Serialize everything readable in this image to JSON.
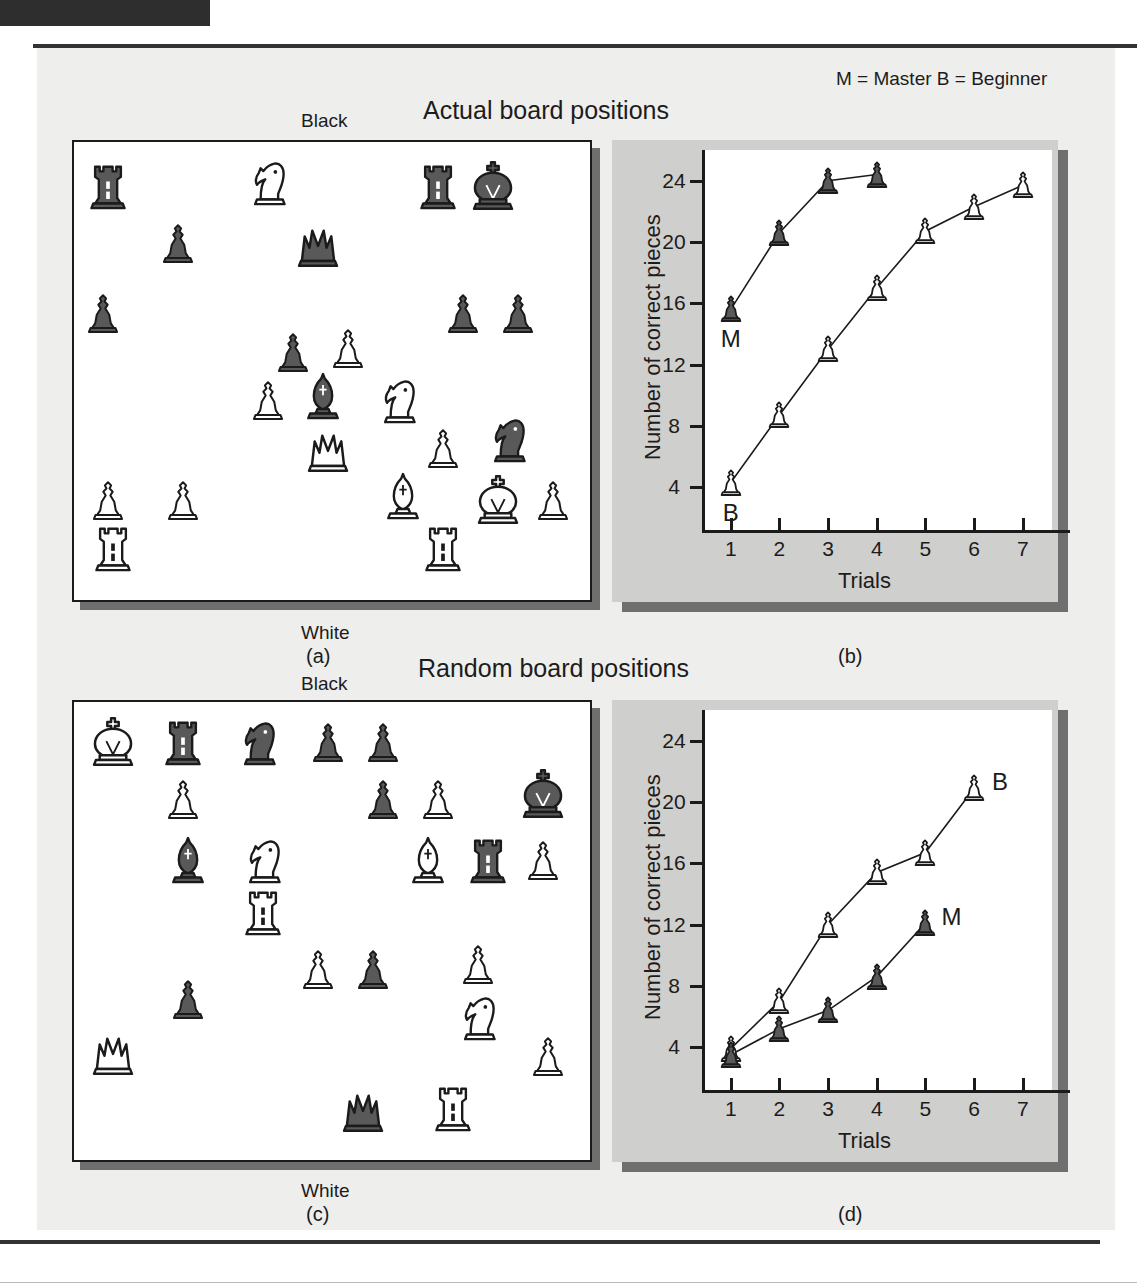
{
  "figure": {
    "legend_note": "M = Master B = Beginner",
    "heading_top": "Actual board positions",
    "heading_bottom": "Random board positions",
    "label_black": "Black",
    "label_white": "White",
    "panel_a": "(a)",
    "panel_b": "(b)",
    "panel_c": "(c)",
    "panel_d": "(d)",
    "colors": {
      "panel_bg": "#eeeeec",
      "chart_bg": "#cfcfcd",
      "plot_bg": "#ffffff",
      "ink": "#1b1b1b",
      "dark_piece": "#595959",
      "shadow": "#6f6f6f"
    }
  },
  "boards": {
    "actual": {
      "caption": "Actual board positions",
      "pieces": [
        {
          "type": "rook",
          "color": "black",
          "x": 6,
          "y": 9
        },
        {
          "type": "knight",
          "color": "white",
          "x": 38,
          "y": 8
        },
        {
          "type": "rook",
          "color": "black",
          "x": 72,
          "y": 9
        },
        {
          "type": "king",
          "color": "black",
          "x": 83,
          "y": 9
        },
        {
          "type": "pawn",
          "color": "black",
          "x": 20,
          "y": 22
        },
        {
          "type": "queen",
          "color": "black",
          "x": 48,
          "y": 22
        },
        {
          "type": "pawn",
          "color": "black",
          "x": 5,
          "y": 38
        },
        {
          "type": "pawn",
          "color": "black",
          "x": 77,
          "y": 38
        },
        {
          "type": "pawn",
          "color": "black",
          "x": 88,
          "y": 38
        },
        {
          "type": "pawn",
          "color": "black",
          "x": 43,
          "y": 47
        },
        {
          "type": "pawn",
          "color": "white",
          "x": 54,
          "y": 46
        },
        {
          "type": "pawn",
          "color": "white",
          "x": 38,
          "y": 58
        },
        {
          "type": "bishop",
          "color": "black",
          "x": 49,
          "y": 57
        },
        {
          "type": "knight",
          "color": "white",
          "x": 64,
          "y": 58
        },
        {
          "type": "queen",
          "color": "white",
          "x": 50,
          "y": 69
        },
        {
          "type": "pawn",
          "color": "white",
          "x": 73,
          "y": 69
        },
        {
          "type": "knight",
          "color": "black",
          "x": 86,
          "y": 67
        },
        {
          "type": "pawn",
          "color": "white",
          "x": 6,
          "y": 81
        },
        {
          "type": "pawn",
          "color": "white",
          "x": 21,
          "y": 81
        },
        {
          "type": "bishop",
          "color": "white",
          "x": 65,
          "y": 80
        },
        {
          "type": "king",
          "color": "white",
          "x": 84,
          "y": 81
        },
        {
          "type": "pawn",
          "color": "white",
          "x": 95,
          "y": 81
        },
        {
          "type": "rook",
          "color": "white",
          "x": 7,
          "y": 92
        },
        {
          "type": "rook",
          "color": "white",
          "x": 73,
          "y": 92
        }
      ]
    },
    "random": {
      "caption": "Random board positions",
      "pieces": [
        {
          "type": "king",
          "color": "white",
          "x": 7,
          "y": 8
        },
        {
          "type": "rook",
          "color": "black",
          "x": 21,
          "y": 8
        },
        {
          "type": "knight",
          "color": "black",
          "x": 36,
          "y": 8
        },
        {
          "type": "pawn",
          "color": "black",
          "x": 50,
          "y": 8
        },
        {
          "type": "pawn",
          "color": "black",
          "x": 61,
          "y": 8
        },
        {
          "type": "pawn",
          "color": "white",
          "x": 21,
          "y": 21
        },
        {
          "type": "pawn",
          "color": "black",
          "x": 61,
          "y": 21
        },
        {
          "type": "pawn",
          "color": "white",
          "x": 72,
          "y": 21
        },
        {
          "type": "king",
          "color": "black",
          "x": 93,
          "y": 20
        },
        {
          "type": "bishop",
          "color": "black",
          "x": 22,
          "y": 35
        },
        {
          "type": "knight",
          "color": "white",
          "x": 37,
          "y": 35
        },
        {
          "type": "bishop",
          "color": "white",
          "x": 70,
          "y": 35
        },
        {
          "type": "rook",
          "color": "black",
          "x": 82,
          "y": 35
        },
        {
          "type": "pawn",
          "color": "white",
          "x": 93,
          "y": 35
        },
        {
          "type": "rook",
          "color": "white",
          "x": 37,
          "y": 47
        },
        {
          "type": "pawn",
          "color": "white",
          "x": 48,
          "y": 60
        },
        {
          "type": "pawn",
          "color": "black",
          "x": 59,
          "y": 60
        },
        {
          "type": "pawn",
          "color": "white",
          "x": 80,
          "y": 59
        },
        {
          "type": "pawn",
          "color": "black",
          "x": 22,
          "y": 67
        },
        {
          "type": "knight",
          "color": "white",
          "x": 80,
          "y": 71
        },
        {
          "type": "queen",
          "color": "white",
          "x": 7,
          "y": 79
        },
        {
          "type": "pawn",
          "color": "white",
          "x": 94,
          "y": 80
        },
        {
          "type": "queen",
          "color": "black",
          "x": 57,
          "y": 92
        },
        {
          "type": "rook",
          "color": "white",
          "x": 75,
          "y": 92
        }
      ]
    }
  },
  "chart_data": [
    {
      "id": "b",
      "type": "line",
      "title": "Actual board positions",
      "panel_letter": "(b)",
      "xlabel": "Trials",
      "ylabel": "Number of correct pieces",
      "xticks": [
        1,
        2,
        3,
        4,
        5,
        6,
        7
      ],
      "yticks": [
        4,
        8,
        12,
        16,
        20,
        24
      ],
      "xlim": [
        0.45,
        7.6
      ],
      "ylim": [
        1.2,
        26.0
      ],
      "grid": false,
      "legend_position": "inline-annotation",
      "series": [
        {
          "name": "M",
          "label": "Master",
          "marker": "dark-pawn",
          "label_position": "below-first-point",
          "x": [
            1,
            2,
            3,
            4
          ],
          "values": [
            15.6,
            20.6,
            24.0,
            24.4
          ]
        },
        {
          "name": "B",
          "label": "Beginner",
          "marker": "white-pawn",
          "label_position": "below-first-point",
          "x": [
            1,
            2,
            3,
            4,
            5,
            6,
            7
          ],
          "values": [
            4.3,
            8.7,
            13.0,
            17.0,
            20.7,
            22.3,
            23.7
          ]
        }
      ]
    },
    {
      "id": "d",
      "type": "line",
      "title": "Random board positions",
      "panel_letter": "(d)",
      "xlabel": "Trials",
      "ylabel": "Number of correct pieces",
      "xticks": [
        1,
        2,
        3,
        4,
        5,
        6,
        7
      ],
      "yticks": [
        4,
        8,
        12,
        16,
        20,
        24
      ],
      "xlim": [
        0.45,
        7.6
      ],
      "ylim": [
        1.2,
        26.0
      ],
      "grid": false,
      "legend_position": "inline-annotation",
      "series": [
        {
          "name": "B",
          "label": "Beginner",
          "marker": "white-pawn",
          "label_position": "right-of-last-point",
          "x": [
            1,
            2,
            3,
            4,
            5,
            6
          ],
          "values": [
            3.9,
            7.0,
            12.0,
            15.4,
            16.7,
            20.9
          ]
        },
        {
          "name": "M",
          "label": "Master",
          "marker": "dark-pawn",
          "label_position": "right-of-last-point",
          "x": [
            1,
            2,
            3,
            4,
            5
          ],
          "values": [
            3.5,
            5.2,
            6.4,
            8.6,
            12.1
          ]
        }
      ]
    }
  ]
}
